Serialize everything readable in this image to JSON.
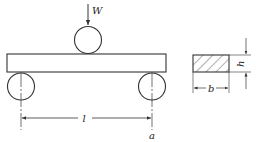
{
  "diagram": {
    "type": "three-point bending test",
    "labels": {
      "load": "W",
      "span": "l",
      "support_point": "a",
      "width": "b",
      "height": "h"
    },
    "colors": {
      "line": "#333333",
      "background": "#ffffff"
    }
  }
}
